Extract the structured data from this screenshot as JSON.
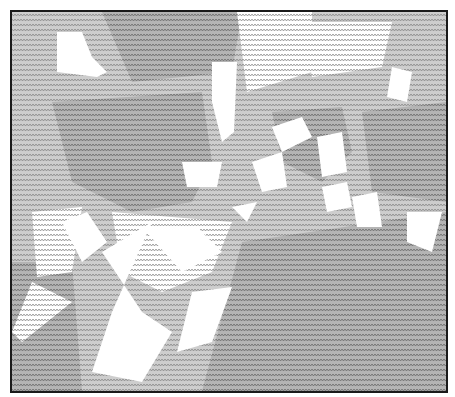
{
  "artwork": {
    "description": "Grayscale ASCII-art style picture made of repeated small characters",
    "texture_glyph": "w",
    "colors": {
      "background": "#ffffff",
      "frame_border": "#1a1a1a",
      "texture_dark": "#8f8f8f",
      "texture_mid": "#aaaaaa",
      "texture_light": "#c4c4c4"
    }
  }
}
